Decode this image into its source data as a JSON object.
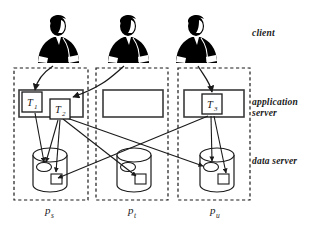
{
  "figure": {
    "background_color": "#ffffff",
    "stroke_color": "#1a1a1a",
    "silhouette_color": "#000000"
  },
  "tier_labels": [
    {
      "id": "client",
      "text": "client"
    },
    {
      "id": "application-server",
      "text": "application\nserver"
    },
    {
      "id": "data-server",
      "text": "data server"
    }
  ],
  "clients": [
    {
      "id": "client-1",
      "name": "client-figure-1",
      "x": 58,
      "y": 32
    },
    {
      "id": "client-2",
      "name": "client-figure-2",
      "x": 128,
      "y": 32
    },
    {
      "id": "client-3",
      "name": "client-figure-3",
      "x": 196,
      "y": 32
    }
  ],
  "processes": [
    {
      "id": "p-s",
      "label": "p",
      "subscript": "s",
      "box": {
        "x": 14,
        "y": 68,
        "w": 74,
        "h": 132
      },
      "app_server_rect": {
        "x": 19,
        "y": 90,
        "w": 64,
        "h": 27
      },
      "transactions": [
        {
          "id": "T1",
          "label": "T",
          "subscript": "1",
          "x": 22,
          "y": 92,
          "w": 20,
          "h": 20
        },
        {
          "id": "T2",
          "label": "T",
          "subscript": "2",
          "x": 50,
          "y": 99,
          "w": 20,
          "h": 20
        }
      ],
      "data_store": {
        "x": 33,
        "y": 148,
        "w": 34,
        "h": 44
      }
    },
    {
      "id": "p-t",
      "label": "p",
      "subscript": "t",
      "box": {
        "x": 96,
        "y": 68,
        "w": 72,
        "h": 132
      },
      "app_server_rect": {
        "x": 103,
        "y": 90,
        "w": 60,
        "h": 27
      },
      "transactions": [],
      "data_store": {
        "x": 117,
        "y": 148,
        "w": 34,
        "h": 44
      }
    },
    {
      "id": "p-u",
      "label": "p",
      "subscript": "u",
      "box": {
        "x": 178,
        "y": 68,
        "w": 72,
        "h": 132
      },
      "app_server_rect": {
        "x": 184,
        "y": 90,
        "w": 60,
        "h": 27
      },
      "transactions": [
        {
          "id": "T3",
          "label": "T",
          "subscript": "3",
          "x": 202,
          "y": 94,
          "w": 20,
          "h": 20
        }
      ],
      "data_store": {
        "x": 200,
        "y": 148,
        "w": 34,
        "h": 44
      }
    }
  ],
  "client_links": [
    {
      "id": "link-client1-T1",
      "from": "client-1",
      "to": "T1"
    },
    {
      "id": "link-client2-T2",
      "from": "client-2",
      "to": "T2"
    },
    {
      "id": "link-client3-T3",
      "from": "client-3",
      "to": "T3"
    }
  ],
  "access_links": [
    {
      "id": "link-T1-ps-ellipse",
      "from": "T1",
      "to": "data-store-ps-ellipse"
    },
    {
      "id": "link-T2-ps-ellipse",
      "from": "T2",
      "to": "data-store-ps-ellipse"
    },
    {
      "id": "link-T2-ps-square",
      "from": "T2",
      "to": "data-store-ps-square"
    },
    {
      "id": "link-T2-pu-ellipse",
      "from": "T2",
      "to": "data-store-pu-ellipse"
    },
    {
      "id": "link-T2-pt-square",
      "from": "T2",
      "to": "data-store-pt-square"
    },
    {
      "id": "link-T3-ps-ellipse",
      "from": "T3",
      "to": "data-store-ps-ellipse"
    },
    {
      "id": "link-T3-pu-ellipse",
      "from": "T3",
      "to": "data-store-pu-ellipse"
    },
    {
      "id": "link-T3-pu-square",
      "from": "T3",
      "to": "data-store-pu-square"
    }
  ]
}
